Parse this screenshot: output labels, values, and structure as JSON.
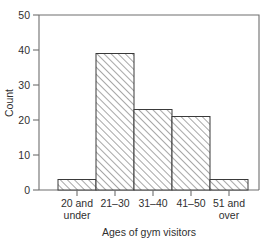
{
  "chart_data": {
    "type": "bar",
    "title": "",
    "subtitle": "",
    "xlabel": "Ages of gym visitors",
    "ylabel": "Count",
    "categories": [
      "20 and under",
      "21–30",
      "31–40",
      "41–50",
      "51 and over"
    ],
    "category_lines": [
      [
        "20 and",
        "under"
      ],
      [
        "21–30",
        ""
      ],
      [
        "31–40",
        ""
      ],
      [
        "41–50",
        ""
      ],
      [
        "51 and",
        "over"
      ]
    ],
    "values": [
      3,
      39,
      23,
      21,
      3
    ],
    "ylim": [
      0,
      50
    ],
    "yticks": [
      0,
      10,
      20,
      30,
      40,
      50
    ],
    "ytick_labels": [
      "0",
      "10",
      "20",
      "30",
      "40",
      "50"
    ],
    "grid": false,
    "legend": null,
    "legend_position": "none",
    "annotations": [],
    "style": {
      "bar_fill": "#ffffff",
      "bar_edge": "#3a3a3a",
      "hatch": "forward-diagonal",
      "hatch_color": "#5a5a5a",
      "axis_color": "#6e6e6e",
      "text_color": "#2f2f2f",
      "background": "#ffffff"
    }
  },
  "axis": {
    "y_title": "Count",
    "x_title": "Ages of gym visitors"
  }
}
